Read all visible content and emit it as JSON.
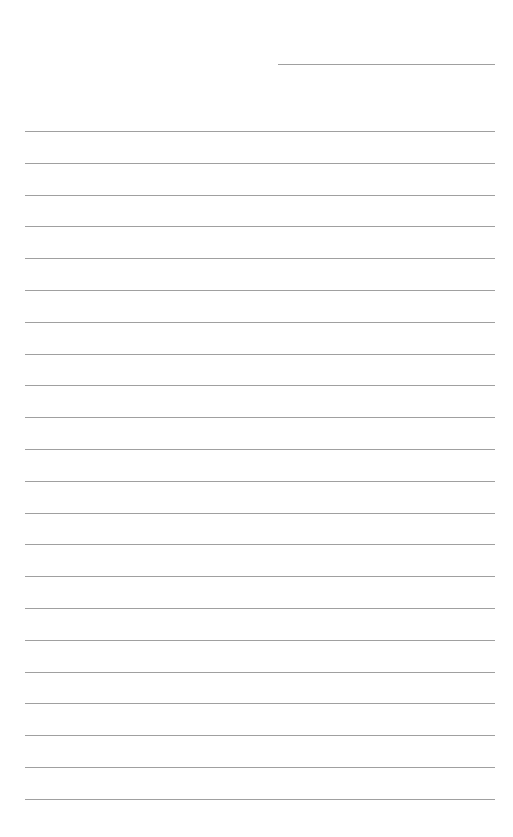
{
  "page": {
    "type": "lined-paper",
    "background_color": "#ffffff",
    "line_color": "#a0a0a0",
    "header_line": {
      "left": 278,
      "top": 64,
      "width": 217
    },
    "ruled_lines": {
      "count": 22,
      "left": 25,
      "width": 470,
      "first_top": 131,
      "spacing": 31.8
    }
  }
}
